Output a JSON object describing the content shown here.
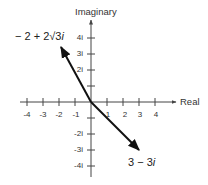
{
  "diagram": {
    "type": "complex-plane",
    "axes": {
      "x_label": "Real",
      "y_label": "Imaginary",
      "x_ticks": [
        "-4",
        "-3",
        "-2",
        "-1",
        "1",
        "2",
        "3",
        "4"
      ],
      "y_ticks_positive": [
        "4i",
        "3i",
        "2i"
      ],
      "y_ticks_negative": [
        "-2i",
        "-3i",
        "-4i"
      ]
    },
    "vectors": [
      {
        "label_prefix": "− 2 + 2√3",
        "label_suffix": "i",
        "real": -2,
        "imag": 3.464
      },
      {
        "label_prefix": "3 − 3",
        "label_suffix": "i",
        "real": 3,
        "imag": -3
      }
    ],
    "colors": {
      "axis": "#444444",
      "vector": "#111111",
      "text": "#333333"
    }
  }
}
